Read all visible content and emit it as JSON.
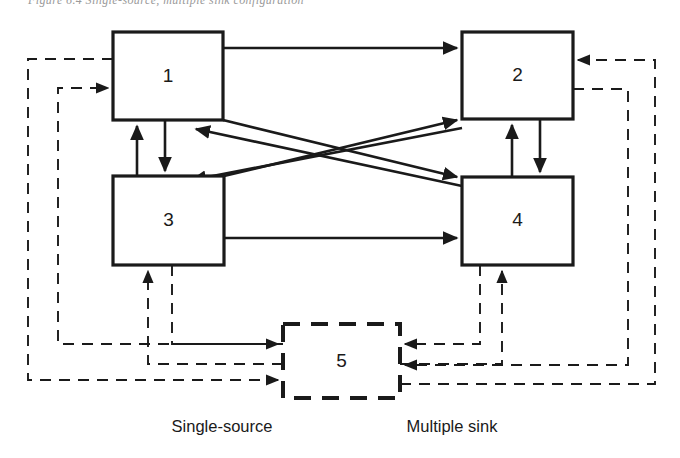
{
  "figure": {
    "type": "block-diagram",
    "title_fragment": "Figure 6.4  Single-source, multiple sink configuration",
    "background_color": "#ffffff",
    "line_color": "#1a1a1a"
  },
  "nodes": [
    {
      "id": "n1",
      "label": "1",
      "style": "solid",
      "x": 113,
      "y": 32,
      "w": 110,
      "h": 88
    },
    {
      "id": "n2",
      "label": "2",
      "style": "solid",
      "x": 462,
      "y": 32,
      "w": 111,
      "h": 87
    },
    {
      "id": "n3",
      "label": "3",
      "style": "solid",
      "x": 113,
      "y": 176,
      "w": 111,
      "h": 89
    },
    {
      "id": "n4",
      "label": "4",
      "style": "solid",
      "x": 462,
      "y": 177,
      "w": 111,
      "h": 88
    },
    {
      "id": "n5",
      "label": "5",
      "style": "dashed",
      "x": 283,
      "y": 324,
      "w": 117,
      "h": 74
    }
  ],
  "captions": [
    {
      "id": "cap-single-source",
      "text": "Single-source",
      "x": 222,
      "y": 426
    },
    {
      "id": "cap-multiple-sink",
      "text": "Multiple sink",
      "x": 452,
      "y": 426
    }
  ],
  "edges": [
    {
      "id": "e1-2",
      "from": "1",
      "to": "2",
      "style": "solid",
      "kind": "horizontal-top"
    },
    {
      "id": "e3-4",
      "from": "3",
      "to": "4",
      "style": "solid",
      "kind": "horizontal-bottom"
    },
    {
      "id": "e1-3",
      "from": "1",
      "to": "3",
      "style": "solid",
      "kind": "vertical-down"
    },
    {
      "id": "e3-1",
      "from": "3",
      "to": "1",
      "style": "solid",
      "kind": "vertical-up"
    },
    {
      "id": "e2-4",
      "from": "2",
      "to": "4",
      "style": "solid",
      "kind": "vertical-down"
    },
    {
      "id": "e4-2",
      "from": "4",
      "to": "2",
      "style": "solid",
      "kind": "vertical-up"
    },
    {
      "id": "e1-4",
      "from": "1",
      "to": "4",
      "style": "solid",
      "kind": "diagonal"
    },
    {
      "id": "e3-2",
      "from": "3",
      "to": "2",
      "style": "solid",
      "kind": "diagonal"
    },
    {
      "id": "e4-1",
      "from": "4",
      "to": "1",
      "style": "solid",
      "kind": "diagonal"
    },
    {
      "id": "e2-3",
      "from": "2",
      "to": "3",
      "style": "solid",
      "kind": "diagonal"
    },
    {
      "id": "e3-5",
      "from": "3",
      "to": "5",
      "style": "dashed",
      "kind": "feedback"
    },
    {
      "id": "e5-3",
      "from": "5",
      "to": "3",
      "style": "dashed",
      "kind": "feedback"
    },
    {
      "id": "e4-5",
      "from": "4",
      "to": "5",
      "style": "dashed",
      "kind": "feedback"
    },
    {
      "id": "e5-4",
      "from": "5",
      "to": "4",
      "style": "dashed",
      "kind": "feedback"
    },
    {
      "id": "e1-5",
      "from": "1",
      "to": "5",
      "style": "dashed",
      "kind": "feedback-outer-left"
    },
    {
      "id": "e5-1",
      "from": "5",
      "to": "1",
      "style": "dashed",
      "kind": "feedback-outer-left"
    },
    {
      "id": "e2-5",
      "from": "2",
      "to": "5",
      "style": "dashed",
      "kind": "feedback-outer-right"
    },
    {
      "id": "e5-2",
      "from": "5",
      "to": "2",
      "style": "dashed",
      "kind": "feedback-outer-right"
    }
  ]
}
